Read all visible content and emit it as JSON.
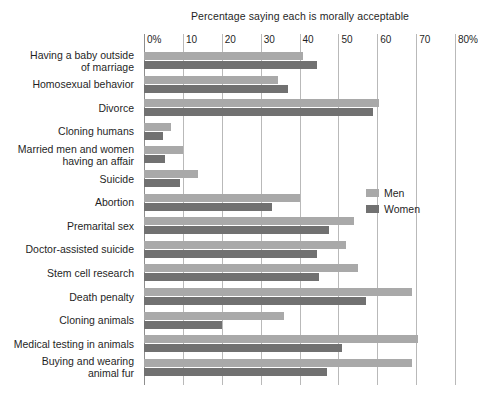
{
  "chart_data": {
    "type": "bar",
    "orientation": "horizontal",
    "title": "Percentage saying each is morally acceptable",
    "xlabel": "",
    "ylabel": "",
    "xlim": [
      0,
      80
    ],
    "xticks": [
      0,
      10,
      20,
      30,
      40,
      50,
      60,
      70,
      80
    ],
    "xticklabels": [
      "0%",
      "10",
      "20",
      "30",
      "40",
      "50",
      "60",
      "70",
      "80%"
    ],
    "grid": true,
    "legend_position": "center-right",
    "categories": [
      "Having a baby outside\nof marriage",
      "Homosexual behavior",
      "Divorce",
      "Cloning humans",
      "Married men and women\nhaving an affair",
      "Suicide",
      "Abortion",
      "Premarital sex",
      "Doctor-assisted suicide",
      "Stem cell research",
      "Death penalty",
      "Cloning animals",
      "Medical testing in animals",
      "Buying and wearing\nanimal fur"
    ],
    "series": [
      {
        "name": "Men",
        "color": "#a9a9a9",
        "values": [
          41,
          34.5,
          60.5,
          7,
          10,
          14,
          40,
          54,
          52,
          55,
          69,
          36,
          70.5,
          69
        ]
      },
      {
        "name": "Women",
        "color": "#717171",
        "values": [
          44.5,
          37,
          59,
          5,
          5.5,
          9.3,
          33,
          47.5,
          44.5,
          45,
          57,
          20,
          51,
          47
        ]
      }
    ]
  },
  "footer": {
    "caption": ""
  }
}
